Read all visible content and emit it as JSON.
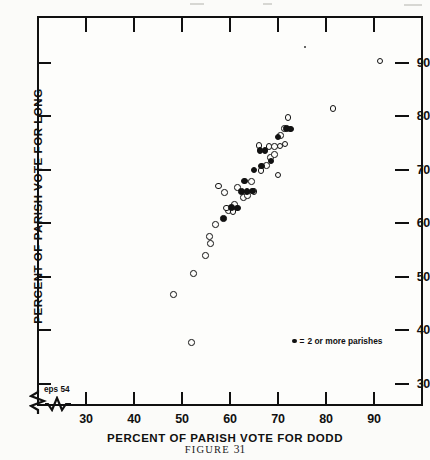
{
  "figure": {
    "caption_prefix": "FIGURE",
    "caption_number": "31"
  },
  "axes": {
    "x_title": "PERCENT OF PARISH  VOTE  FOR  DODD",
    "y_title": "PERCENT OF PARISH VOTE FOR LONG",
    "x_ticks": [
      "30",
      "40",
      "50",
      "60",
      "70",
      "80",
      "90"
    ],
    "y_ticks": [
      "90",
      "80",
      "70",
      "60",
      "50",
      "40",
      "30"
    ],
    "break_note": "eps 54"
  },
  "legend": {
    "marker": "filled-dot",
    "equals": "=",
    "text": "2 or more parishes"
  },
  "chart_data": {
    "type": "scatter",
    "title": "FIGURE 31",
    "xlabel": "PERCENT OF PARISH VOTE FOR DODD",
    "ylabel": "PERCENT OF PARISH VOTE FOR LONG",
    "xlim": [
      24,
      96
    ],
    "ylim": [
      26,
      96
    ],
    "xticks": [
      30,
      40,
      50,
      60,
      70,
      80,
      90
    ],
    "yticks": [
      30,
      40,
      50,
      60,
      70,
      80,
      90
    ],
    "grid": false,
    "axis_break": {
      "x": true,
      "y": true,
      "note": "eps 54"
    },
    "legend": {
      "position": "inside-lower-right",
      "entries": [
        {
          "marker": "filled",
          "label": "2 or more parishes"
        }
      ]
    },
    "series": [
      {
        "name": "single parish",
        "marker": "open-circle",
        "points": [
          [
            51.9,
            37.8
          ],
          [
            48.2,
            46.7
          ],
          [
            52.4,
            50.7
          ],
          [
            54.9,
            54.0
          ],
          [
            55.9,
            56.3
          ],
          [
            55.7,
            57.6
          ],
          [
            57.0,
            59.8
          ],
          [
            59.7,
            62.5
          ],
          [
            59.2,
            62.9
          ],
          [
            60.6,
            62.3
          ],
          [
            60.9,
            63.6
          ],
          [
            58.8,
            65.8
          ],
          [
            57.6,
            67.0
          ],
          [
            61.6,
            66.8
          ],
          [
            62.8,
            64.9
          ],
          [
            63.6,
            65.3
          ],
          [
            65.0,
            66.0
          ],
          [
            64.5,
            67.9
          ],
          [
            66.4,
            69.9
          ],
          [
            67.6,
            70.9
          ],
          [
            68.4,
            72.3
          ],
          [
            69.3,
            72.9
          ],
          [
            66.0,
            74.6
          ],
          [
            68.1,
            74.4
          ],
          [
            69.2,
            74.4
          ],
          [
            70.4,
            74.5
          ],
          [
            71.4,
            74.9
          ],
          [
            70.5,
            76.5
          ],
          [
            71.3,
            77.8
          ],
          [
            72.1,
            79.8
          ],
          [
            70.0,
            69.1
          ],
          [
            81.4,
            81.5
          ],
          [
            91.2,
            90.4
          ]
        ]
      },
      {
        "name": "2 or more parishes",
        "marker": "filled-dot",
        "points": [
          [
            58.6,
            61.0
          ],
          [
            60.3,
            63.0
          ],
          [
            61.5,
            62.9
          ],
          [
            62.4,
            66.0
          ],
          [
            63.5,
            66.0
          ],
          [
            64.7,
            66.1
          ],
          [
            63.0,
            68.0
          ],
          [
            65.0,
            70.0
          ],
          [
            66.6,
            70.8
          ],
          [
            66.2,
            73.7
          ],
          [
            67.3,
            73.7
          ],
          [
            68.5,
            71.7
          ],
          [
            70.0,
            76.2
          ],
          [
            71.7,
            77.8
          ],
          [
            72.6,
            77.7
          ]
        ]
      },
      {
        "name": "faint mark",
        "marker": "tiny-dot",
        "points": [
          [
            75.6,
            93.0
          ]
        ]
      }
    ]
  }
}
